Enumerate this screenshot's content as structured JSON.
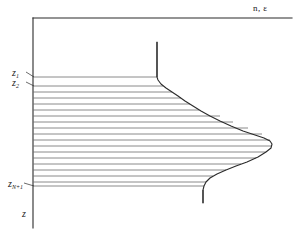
{
  "figure": {
    "background": "#ffffff",
    "ink_color": "#2b2b2b",
    "grid_color": "#6d6d6d",
    "width": 302,
    "height": 241
  },
  "axes": {
    "top_axis_label": "n, ε",
    "vertical_axis_label": "z",
    "origin": {
      "x": 33,
      "y": 18
    },
    "top_axis_end_x": 292,
    "vertical_axis_end_y": 228,
    "direction_note": "z increases downward"
  },
  "tick_labels": [
    {
      "name": "z1",
      "text": "z",
      "subscript": "1",
      "points_to_y": 77
    },
    {
      "name": "z2",
      "text": "z",
      "subscript": "2",
      "points_to_y": 86
    },
    {
      "name": "zN1",
      "text": "z",
      "subscript": "N+1",
      "points_to_y": 186
    }
  ],
  "chart_data": {
    "type": "line",
    "xlabel": "n, ε",
    "ylabel": "z",
    "grid": false,
    "legend": "none",
    "orientation": "horizontal-value-vertical-depth",
    "xlim": [
      33,
      292
    ],
    "ylim": [
      18,
      228
    ],
    "curve_points": [
      [
        157,
        42
      ],
      [
        157,
        60
      ],
      [
        157,
        70
      ],
      [
        157,
        77
      ],
      [
        158,
        80
      ],
      [
        161,
        84
      ],
      [
        166,
        88
      ],
      [
        172,
        92
      ],
      [
        178,
        96
      ],
      [
        185,
        101
      ],
      [
        193,
        106
      ],
      [
        201,
        111
      ],
      [
        210,
        116
      ],
      [
        220,
        121
      ],
      [
        231,
        126
      ],
      [
        243,
        131
      ],
      [
        255,
        135
      ],
      [
        264,
        138
      ],
      [
        270,
        141
      ],
      [
        272,
        144
      ],
      [
        271,
        148
      ],
      [
        266,
        152
      ],
      [
        258,
        157
      ],
      [
        247,
        162
      ],
      [
        236,
        166
      ],
      [
        226,
        170
      ],
      [
        217,
        174
      ],
      [
        210,
        178
      ],
      [
        206,
        182
      ],
      [
        204,
        186
      ],
      [
        203,
        190
      ],
      [
        203,
        203
      ]
    ],
    "slab_lines": [
      {
        "index": 1,
        "y": 77,
        "x_start": 33,
        "x_end": 157
      },
      {
        "index": 2,
        "y": 86,
        "x_start": 33,
        "x_end": 163
      },
      {
        "index": 3,
        "y": 92,
        "x_start": 33,
        "x_end": 172
      },
      {
        "index": 4,
        "y": 98,
        "x_start": 33,
        "x_end": 181
      },
      {
        "index": 5,
        "y": 104,
        "x_start": 33,
        "x_end": 190
      },
      {
        "index": 6,
        "y": 110,
        "x_start": 33,
        "x_end": 199
      },
      {
        "index": 7,
        "y": 116,
        "x_start": 33,
        "x_end": 220
      },
      {
        "index": 8,
        "y": 122,
        "x_start": 33,
        "x_end": 233
      },
      {
        "index": 9,
        "y": 128,
        "x_start": 33,
        "x_end": 248
      },
      {
        "index": 10,
        "y": 134,
        "x_start": 33,
        "x_end": 262
      },
      {
        "index": 11,
        "y": 140,
        "x_start": 33,
        "x_end": 270
      },
      {
        "index": 12,
        "y": 146,
        "x_start": 33,
        "x_end": 271
      },
      {
        "index": 13,
        "y": 152,
        "x_start": 33,
        "x_end": 266
      },
      {
        "index": 14,
        "y": 158,
        "x_start": 33,
        "x_end": 256
      },
      {
        "index": 15,
        "y": 164,
        "x_start": 33,
        "x_end": 241
      },
      {
        "index": 16,
        "y": 170,
        "x_start": 33,
        "x_end": 226
      },
      {
        "index": 17,
        "y": 176,
        "x_start": 33,
        "x_end": 213
      },
      {
        "index": 18,
        "y": 182,
        "x_start": 33,
        "x_end": 206
      },
      {
        "index": 19,
        "y": 186,
        "x_start": 33,
        "x_end": 204
      }
    ],
    "annotations": [
      {
        "name": "upper-vertical-tail",
        "from": [
          157,
          42
        ],
        "to": [
          157,
          77
        ]
      },
      {
        "name": "lower-vertical-tail",
        "from": [
          203,
          190
        ],
        "to": [
          203,
          203
        ]
      }
    ]
  }
}
